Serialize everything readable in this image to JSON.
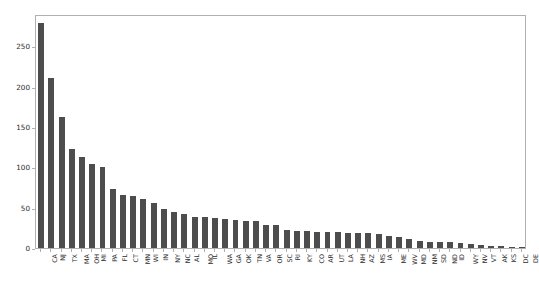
{
  "chart_data": {
    "type": "bar",
    "title": "",
    "subtitle": "",
    "xlabel": "",
    "ylabel": "",
    "grid": false,
    "legend": false,
    "legend_position": "none",
    "bar_color": "#4d4d4d",
    "axis_color": "#b0b0b0",
    "background_color": "#ffffff",
    "xlim_categories": 51,
    "ylim": [
      0,
      290
    ],
    "ytick_labels": [
      "0",
      "50",
      "100",
      "150",
      "200",
      "250"
    ],
    "yticks": [
      0,
      50,
      100,
      150,
      200,
      250
    ],
    "categories": [
      "CA",
      "NJ",
      "TX",
      "MA",
      "OH",
      "MI",
      "PA",
      "FL",
      "CT",
      "MN",
      "WI",
      "IN",
      "NY",
      "NC",
      "AL",
      "MO",
      "IL",
      "WA",
      "GA",
      "OK",
      "TN",
      "VA",
      "OR",
      "SC",
      "RI",
      "KY",
      "CO",
      "AR",
      "UT",
      "LA",
      "NH",
      "AZ",
      "MS",
      "IA",
      "ME",
      "WV",
      "MD",
      "NM",
      "SD",
      "ND",
      "ID",
      "WY",
      "NV",
      "VT",
      "AK",
      "KS",
      "DC",
      "DE"
    ],
    "values": [
      279,
      211,
      162,
      123,
      113,
      104,
      100,
      73,
      66,
      65,
      61,
      56,
      48,
      45,
      42,
      39,
      38,
      37,
      36,
      35,
      34,
      33,
      29,
      28,
      22,
      21,
      21,
      20,
      20,
      20,
      19,
      19,
      18,
      17,
      15,
      14,
      11,
      9,
      8,
      7,
      7,
      6,
      5,
      4,
      3,
      2,
      1,
      1
    ]
  }
}
